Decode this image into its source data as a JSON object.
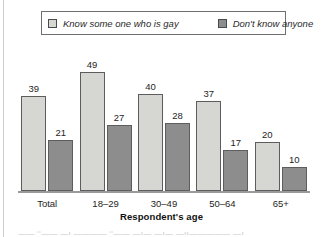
{
  "chart_data": {
    "type": "bar",
    "title": "",
    "xlabel": "Respondent's age",
    "ylabel": "",
    "ylim": [
      0,
      55
    ],
    "grid": false,
    "legend_position": "top",
    "categories": [
      "Total",
      "18–29",
      "30–49",
      "50–64",
      "65+"
    ],
    "series": [
      {
        "name": "Know some one who is gay",
        "color": "#d6d6d2",
        "values": [
          39,
          49,
          40,
          37,
          20
        ]
      },
      {
        "name": "Don't know anyone",
        "color": "#8d8d8d",
        "values": [
          21,
          27,
          28,
          17,
          10
        ]
      }
    ]
  },
  "legend": {
    "entries": [
      {
        "label": "Know some one who is gay",
        "swatch": "legend-swatch-light"
      },
      {
        "label": "Don't know anyone",
        "swatch": "legend-swatch-dark"
      }
    ]
  },
  "axis": {
    "x_title": "Respondent's age"
  },
  "artifacts": {
    "bottom_clipped_text": "―— ‘‘―— —ı ―——— ‘‘——  —ı― ―ı— —ıı————— —ı"
  }
}
